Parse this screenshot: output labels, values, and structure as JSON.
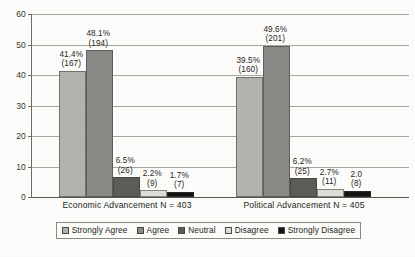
{
  "chart_data": {
    "type": "bar",
    "title": "",
    "subtitle": "",
    "xlabel": "",
    "ylabel": "",
    "ylim": [
      0,
      60
    ],
    "ytick_labels": [
      "0",
      "10",
      "20",
      "30",
      "40",
      "50",
      "60"
    ],
    "ytick_values": [
      0,
      10,
      20,
      30,
      40,
      50,
      60
    ],
    "grid": true,
    "legend_position": "bottom",
    "categories": [
      "Economic Advancement  N = 403",
      "Political Advancement  N = 405"
    ],
    "category_labels": [
      {
        "name": "Economic Advancement",
        "n_label": "N = 403",
        "full": "Economic Advancement  N = 403"
      },
      {
        "name": "Political Advancement",
        "n_label": "N = 405",
        "full": "Political Advancement  N = 405"
      }
    ],
    "series": [
      {
        "name": "Strongly Agree",
        "color": "#b3b3b0",
        "values": [
          41.4,
          39.5
        ],
        "counts": [
          167,
          160
        ],
        "labels_pct": [
          "41.4%",
          "39.5%"
        ],
        "labels_count": [
          "(167)",
          "(160)"
        ]
      },
      {
        "name": "Agree",
        "color": "#8a8a87",
        "values": [
          48.1,
          49.6
        ],
        "counts": [
          194,
          201
        ],
        "labels_pct": [
          "48.1%",
          "49.6%"
        ],
        "labels_count": [
          "(194)",
          "(201)"
        ]
      },
      {
        "name": "Neutral",
        "color": "#5c5c59",
        "values": [
          6.5,
          6.2
        ],
        "counts": [
          26,
          25
        ],
        "labels_pct": [
          "6.5%",
          "6.2%"
        ],
        "labels_count": [
          "(26)",
          "(25)"
        ]
      },
      {
        "name": "Disagree",
        "color": "#dededa",
        "values": [
          2.2,
          2.7
        ],
        "counts": [
          9,
          11
        ],
        "labels_pct": [
          "2.2%",
          "2.7%"
        ],
        "labels_count": [
          "(9)",
          "(11)"
        ]
      },
      {
        "name": "Strongly Disagree",
        "color": "#141414",
        "values": [
          1.7,
          2.0
        ],
        "counts": [
          7,
          8
        ],
        "labels_pct": [
          "1.7%",
          "2.0"
        ],
        "labels_count": [
          "(7)",
          "(8)"
        ]
      }
    ]
  },
  "legend": {
    "items": [
      {
        "label": "Strongly Agree",
        "color": "#b3b3b0"
      },
      {
        "label": "Agree",
        "color": "#8a8a87"
      },
      {
        "label": "Neutral",
        "color": "#5c5c59"
      },
      {
        "label": "Disagree",
        "color": "#dededa"
      },
      {
        "label": "Strongly Disagree",
        "color": "#141414"
      }
    ]
  },
  "theme": {
    "background": "#fdfdfb",
    "gridline": "#a9a6a1",
    "axis": "#6d6a66",
    "text": "#231f20"
  }
}
